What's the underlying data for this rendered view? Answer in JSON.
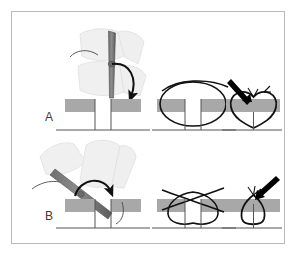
{
  "figure": {
    "frame": {
      "border_color": "#b9b9b9",
      "background_color": "#ffffff"
    },
    "palette": {
      "tissue_band": "#a8a8a8",
      "tissue_band_light": "#c9c9c9",
      "needle_holder": "#7a7a7a",
      "needle_holder_dark": "#5d5d5d",
      "ghost_instrument": "#ededed",
      "ghost_instrument_stroke": "#dcdcdc",
      "suture_line": "#1a1a1a",
      "arrow_black": "#000000",
      "label_text": "#3a3a3a",
      "skin_line": "#555555"
    },
    "panels": [
      {
        "id": "A",
        "label": "A",
        "description": "Needle held perpendicular to the skin surface; suture loop is wide and deep, producing everted wound edges",
        "steps": [
          {
            "id": "A1",
            "name": "needle-entry-perpendicular",
            "elements": [
              "ghost-forceps-upper",
              "ghost-forceps-lower",
              "needle-holder-vertical",
              "curved-rotation-arrow",
              "tissue-block-left",
              "tissue-block-right",
              "wound-gap"
            ]
          },
          {
            "id": "A2",
            "name": "suture-loop-wide-deep",
            "elements": [
              "suture-loop-oval",
              "suture-tail-top",
              "tissue-band",
              "wound-gap",
              "deep-base-line"
            ]
          },
          {
            "id": "A3",
            "name": "wound-edges-everted",
            "elements": [
              "everted-closure-heart-shape",
              "knot-whiskers",
              "arrow-pointer",
              "tissue-band",
              "deep-base-line"
            ]
          }
        ]
      },
      {
        "id": "B",
        "label": "B",
        "description": "Needle held obliquely to the skin surface; suture loop is narrow and shallow, producing inverted/flat wound edges",
        "steps": [
          {
            "id": "B1",
            "name": "needle-entry-oblique",
            "elements": [
              "ghost-forceps-upper-left",
              "ghost-forceps-upper-right",
              "needle-holder-angled",
              "curved-rotation-arrow",
              "suture-thread-tail",
              "tissue-block-left",
              "tissue-block-right",
              "wound-gap"
            ]
          },
          {
            "id": "B2",
            "name": "suture-loop-narrow-shallow",
            "elements": [
              "suture-loop-crossed",
              "suture-tails-crossing",
              "tissue-band",
              "wound-gap",
              "deep-base-line"
            ]
          },
          {
            "id": "B3",
            "name": "wound-edges-inverted",
            "elements": [
              "inverted-closure-teardrop-shape",
              "knot-whiskers",
              "arrow-pointer",
              "tissue-band",
              "deep-base-line"
            ]
          }
        ]
      }
    ]
  }
}
